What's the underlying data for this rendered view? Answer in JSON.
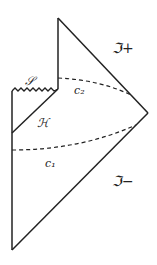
{
  "diagram": {
    "type": "penrose-diagram",
    "labels": {
      "scri_plus": "ℑ+",
      "scri_minus": "ℑ−",
      "singularity": "𝒮",
      "horizon": "ℋ",
      "curve_2": "c₂",
      "curve_1": "c₁"
    },
    "colors": {
      "line": "#222222",
      "background": "#ffffff"
    }
  }
}
